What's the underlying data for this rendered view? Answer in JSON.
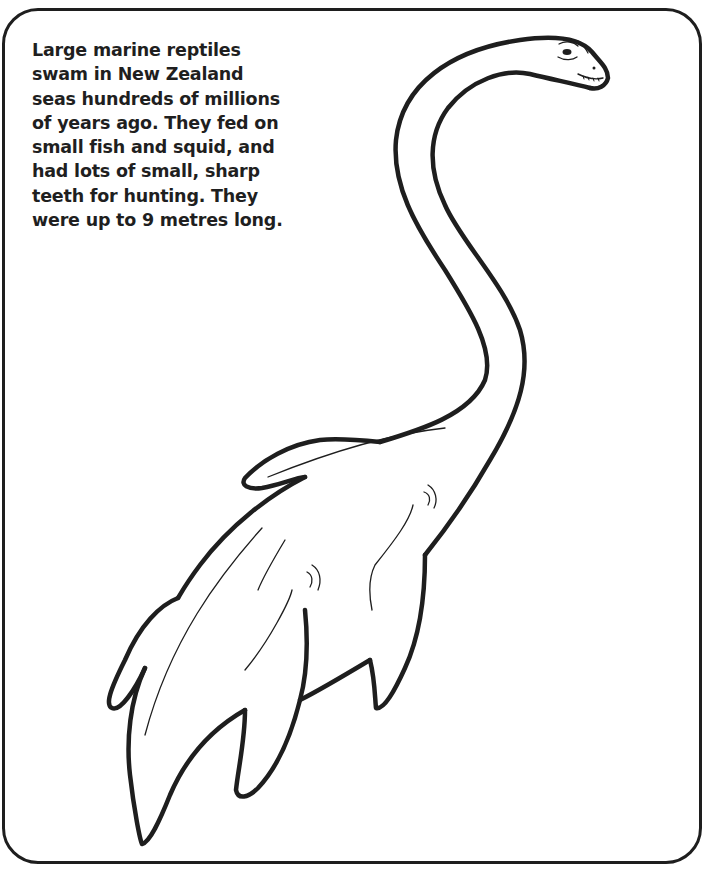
{
  "page": {
    "type": "colouring-page",
    "caption_lines": [
      "Large marine reptiles",
      "swam in New Zealand",
      "seas hundreds of millions",
      "of years ago. They fed on",
      "small fish and squid, and",
      "had lots of small, sharp",
      "teeth for hunting. They",
      "were up to 9 metres long."
    ]
  },
  "colors": {
    "line": "#1e1e1e",
    "background": "#ffffff"
  }
}
